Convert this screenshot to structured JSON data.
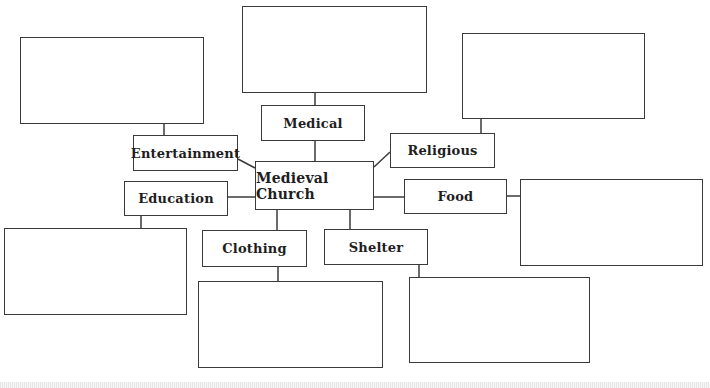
{
  "diagram": {
    "type": "concept-map",
    "center": {
      "label": "Medieval Church"
    },
    "categories": [
      {
        "id": "medical",
        "label": "Medical",
        "answer_box": ""
      },
      {
        "id": "entertainment",
        "label": "Entertainment",
        "answer_box": ""
      },
      {
        "id": "religious",
        "label": "Religious",
        "answer_box": ""
      },
      {
        "id": "education",
        "label": "Education",
        "answer_box": ""
      },
      {
        "id": "food",
        "label": "Food",
        "answer_box": ""
      },
      {
        "id": "clothing",
        "label": "Clothing",
        "answer_box": ""
      },
      {
        "id": "shelter",
        "label": "Shelter",
        "answer_box": ""
      }
    ],
    "colors": {
      "stroke": "#3a3a3a",
      "text": "#1e1e1e",
      "background": "#ffffff"
    }
  }
}
